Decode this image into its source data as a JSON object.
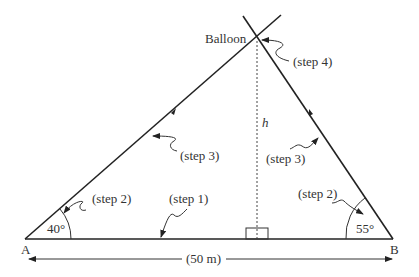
{
  "diagram": {
    "type": "triangulation",
    "points": {
      "A": {
        "label": "A"
      },
      "B": {
        "label": "B"
      },
      "apex": {
        "label": "Balloon"
      }
    },
    "angles": {
      "A": "40°",
      "B": "55°"
    },
    "height_label": "h",
    "baseline_label": "(50 m)",
    "steps": {
      "step1": "(step 1)",
      "step2_left": "(step 2)",
      "step2_right": "(step 2)",
      "step3_left": "(step 3)",
      "step3_right": "(step 3)",
      "step4": "(step 4)"
    },
    "colors": {
      "line": "#222222",
      "text": "#333333",
      "background": "#ffffff"
    }
  }
}
